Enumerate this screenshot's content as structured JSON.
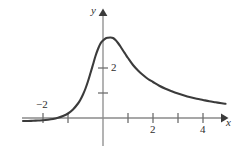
{
  "figure": {
    "background_color": "#ffffff",
    "curve_color": "#3b3b3b",
    "axis_color": "#8a8a8a",
    "text_color": "#2e2e2e",
    "width": 236,
    "height": 158
  },
  "axes": {
    "x_label": "x",
    "y_label": "y",
    "origin_px": {
      "x": 103,
      "y": 118
    },
    "unit_px": {
      "x": 25,
      "y": 25
    },
    "x_tick_labels": [
      {
        "text": "−2",
        "value": -2,
        "px_x": 38,
        "px_y": 100
      },
      {
        "text": "2",
        "value": 2,
        "px_x": 150,
        "px_y": 124
      },
      {
        "text": "4",
        "value": 4,
        "px_x": 200,
        "px_y": 124
      }
    ],
    "y_tick_labels": [
      {
        "text": "2",
        "value": 2,
        "px_x": 110,
        "px_y": 62
      }
    ],
    "x_label_px": {
      "x": 226,
      "y": 120
    },
    "y_label_px": {
      "x": 91,
      "y": 6
    }
  },
  "chart_data": {
    "type": "line",
    "title": "",
    "xlabel": "x",
    "ylabel": "y",
    "xlim": [
      -3.2,
      4.9
    ],
    "ylim": [
      -0.6,
      3.9
    ],
    "grid": false,
    "legend": null,
    "x_ticks": [
      -2,
      -1,
      1,
      2,
      3,
      4
    ],
    "x_tick_labels_shown": [
      "-2",
      "2",
      "4"
    ],
    "y_ticks": [
      1,
      2
    ],
    "y_tick_labels_shown": [
      "2"
    ],
    "series": [
      {
        "name": "f(x)",
        "color": "#3b3b3b",
        "description": "Smooth unimodal curve: flat near zero on the left, rising steeply just left of the origin, peaking near x = 0.4 at y ≈ 3.2, then decaying slowly toward zero on the right.",
        "x": [
          -3.2,
          -3.0,
          -2.8,
          -2.6,
          -2.4,
          -2.2,
          -2.0,
          -1.8,
          -1.6,
          -1.4,
          -1.2,
          -1.0,
          -0.9,
          -0.8,
          -0.7,
          -0.6,
          -0.5,
          -0.4,
          -0.3,
          -0.2,
          -0.1,
          0.0,
          0.1,
          0.2,
          0.3,
          0.4,
          0.5,
          0.6,
          0.7,
          0.8,
          0.9,
          1.0,
          1.2,
          1.4,
          1.6,
          1.8,
          2.0,
          2.25,
          2.5,
          2.75,
          3.0,
          3.25,
          3.5,
          3.75,
          4.0,
          4.25,
          4.5,
          4.75,
          4.9
        ],
        "y": [
          -0.12,
          -0.12,
          -0.11,
          -0.1,
          -0.09,
          -0.07,
          -0.04,
          0.01,
          0.08,
          0.18,
          0.34,
          0.58,
          0.74,
          0.94,
          1.18,
          1.47,
          1.8,
          2.14,
          2.48,
          2.76,
          2.98,
          3.1,
          3.18,
          3.21,
          3.22,
          3.2,
          3.12,
          3.0,
          2.86,
          2.7,
          2.55,
          2.4,
          2.12,
          1.9,
          1.72,
          1.56,
          1.44,
          1.29,
          1.17,
          1.07,
          0.98,
          0.9,
          0.83,
          0.77,
          0.72,
          0.67,
          0.63,
          0.59,
          0.57
        ]
      }
    ]
  }
}
